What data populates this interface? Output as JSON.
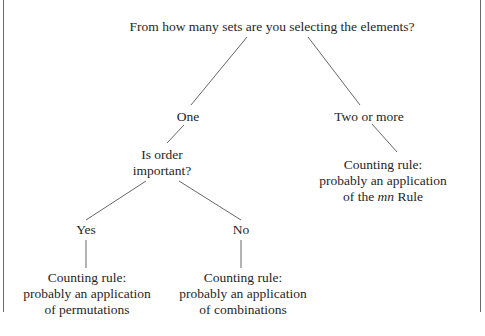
{
  "diagram": {
    "type": "decision-tree",
    "root": {
      "question": "From how many sets are you selecting the elements?"
    },
    "branches": {
      "one": {
        "label": "One",
        "question_line1": "Is order",
        "question_line2": "important?",
        "yes": {
          "label": "Yes",
          "result_line1": "Counting rule:",
          "result_line2": "probably an application",
          "result_line3": "of permutations"
        },
        "no": {
          "label": "No",
          "result_line1": "Counting rule:",
          "result_line2": "probably an application",
          "result_line3": "of combinations"
        }
      },
      "two_or_more": {
        "label": "Two or more",
        "result_line1": "Counting rule:",
        "result_line2": "probably an application",
        "result_line3_prefix": "of the ",
        "result_line3_italic": "mn",
        "result_line3_suffix": " Rule"
      }
    },
    "colors": {
      "text": "#1f1f1f",
      "lines": "#555555",
      "frame": "#6a6a6a",
      "background": "#ffffff"
    }
  }
}
